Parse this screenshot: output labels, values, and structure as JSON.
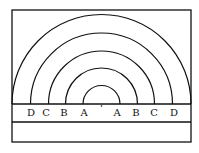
{
  "diagram": {
    "stroke_color": "#111111",
    "background": "#ffffff",
    "frame": {
      "x": 12,
      "y": 10,
      "width": 179,
      "height": 132
    },
    "base_line_y": 104,
    "second_line_y": 122,
    "center_x": 101.5,
    "arcs": [
      {
        "name": "A",
        "radius": 18.5
      },
      {
        "name": "B",
        "radius": 36
      },
      {
        "name": "C",
        "radius": 53
      },
      {
        "name": "D",
        "radius": 71
      },
      {
        "name": "outer",
        "radius": 89.5
      }
    ],
    "labels": [
      {
        "text": "D",
        "x": 31
      },
      {
        "text": "C",
        "x": 46
      },
      {
        "text": "B",
        "x": 64
      },
      {
        "text": "A",
        "x": 84
      },
      {
        "text": "A",
        "x": 117
      },
      {
        "text": "B",
        "x": 136
      },
      {
        "text": "C",
        "x": 154
      },
      {
        "text": "D",
        "x": 174
      }
    ],
    "label_y": 116
  }
}
